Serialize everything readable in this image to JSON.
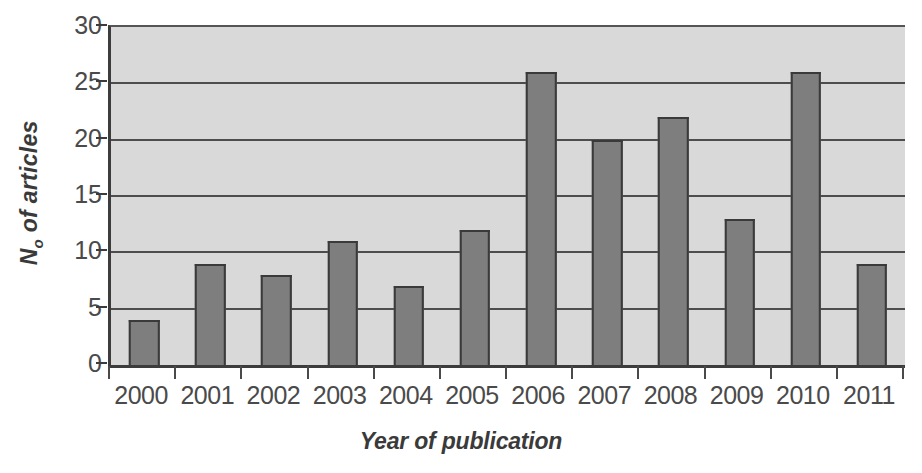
{
  "chart_data": {
    "type": "bar",
    "title": "",
    "categories": [
      "2000",
      "2001",
      "2002",
      "2003",
      "2004",
      "2005",
      "2006",
      "2007",
      "2008",
      "2009",
      "2010",
      "2011"
    ],
    "values": [
      4,
      9,
      8,
      11,
      7,
      12,
      26,
      20,
      22,
      13,
      26,
      9
    ],
    "xlabel": "Year of publication",
    "ylabel_prefix": "N",
    "ylabel_subscript": "o",
    "ylabel_suffix": " of articles",
    "ylabel_plain": "No of articles",
    "ylim": [
      0,
      30
    ],
    "yticks": [
      0,
      5,
      10,
      15,
      20,
      25,
      30
    ],
    "ytick_labels": [
      "0",
      "5",
      "10",
      "15",
      "20",
      "25",
      "30"
    ],
    "grid": true,
    "grid_axis": "y",
    "legend": false,
    "legend_position": "none",
    "bar_color": "#7e7e7e",
    "bar_border_color": "#3a3a3a",
    "plot_background": "#d9d9d9",
    "axis_color": "#3c3c3c",
    "gridline_color": "#4d4d4d",
    "text_color": "#4a4a4a",
    "figure_background": "#ffffff"
  }
}
